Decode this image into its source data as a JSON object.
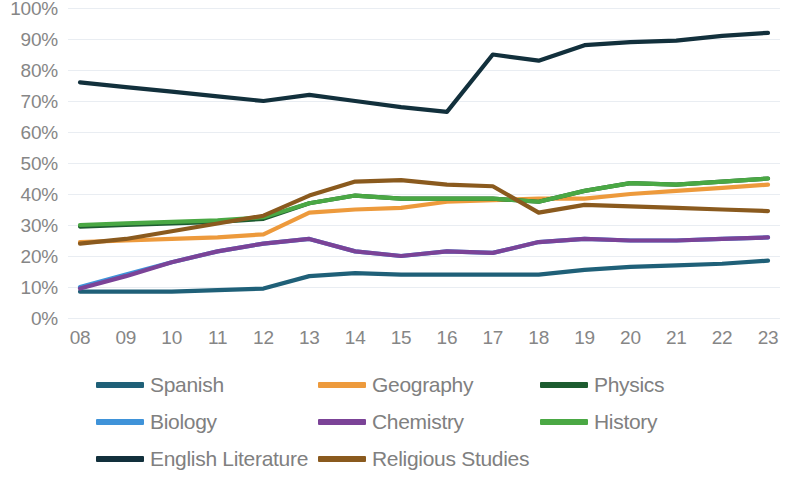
{
  "chart_data": {
    "type": "line",
    "title": "",
    "xlabel": "",
    "ylabel": "",
    "x": [
      "08",
      "09",
      "10",
      "11",
      "12",
      "13",
      "14",
      "15",
      "16",
      "17",
      "18",
      "19",
      "20",
      "21",
      "22",
      "23"
    ],
    "ylim": [
      0,
      100
    ],
    "ytick_labels": [
      "100%",
      "90%",
      "80%",
      "70%",
      "60%",
      "50%",
      "40%",
      "30%",
      "20%",
      "10%",
      "0%"
    ],
    "ytick_values": [
      100,
      90,
      80,
      70,
      60,
      50,
      40,
      30,
      20,
      10,
      0
    ],
    "grid": true,
    "legend_position": "bottom",
    "value_unit": "%",
    "series": [
      {
        "name": "Spanish",
        "color": "#1f6078",
        "values": [
          8.5,
          8.5,
          8.5,
          9,
          9.5,
          13.5,
          14.5,
          14,
          14,
          14,
          14,
          15.5,
          16.5,
          17,
          17.5,
          18.5
        ]
      },
      {
        "name": "Geography",
        "color": "#ed9a3c",
        "values": [
          24.5,
          25,
          25.5,
          26,
          27,
          34,
          35,
          35.5,
          37.5,
          38,
          38.5,
          38.5,
          40,
          41,
          42,
          43
        ]
      },
      {
        "name": "Physics",
        "color": "#1d5c30",
        "values": [
          29.5,
          30,
          30.5,
          31,
          32,
          37,
          39.5,
          38.5,
          38.5,
          38.5,
          37.5,
          41,
          43.5,
          43,
          44,
          45
        ]
      },
      {
        "name": "Biology",
        "color": "#3f93d9",
        "values": [
          10,
          14,
          18,
          21.5,
          24,
          25.5,
          21.5,
          20,
          21.5,
          21,
          24.5,
          25.5,
          25,
          25,
          25.5,
          26
        ]
      },
      {
        "name": "Chemistry",
        "color": "#7b4397",
        "values": [
          9.5,
          13.5,
          18,
          21.5,
          24,
          25.5,
          21.5,
          20,
          21.5,
          21,
          24.5,
          25.5,
          25,
          25,
          25.5,
          26
        ]
      },
      {
        "name": "History",
        "color": "#4aa844",
        "values": [
          30,
          30.5,
          31,
          31.5,
          32.5,
          37,
          39.5,
          38.5,
          38.5,
          38.5,
          37.5,
          41,
          43.5,
          43,
          44,
          45
        ]
      },
      {
        "name": "English Literature",
        "color": "#12303c",
        "values": [
          76,
          74.5,
          73,
          71.5,
          70,
          72,
          70,
          68,
          66.5,
          85,
          83,
          88,
          89,
          89.5,
          91,
          92
        ]
      },
      {
        "name": "Religious Studies",
        "color": "#8a5a1e",
        "values": [
          24,
          25.5,
          28,
          30.5,
          33,
          39.5,
          44,
          44.5,
          43,
          42.5,
          34,
          36.5,
          36,
          35.5,
          35,
          34.5
        ]
      }
    ]
  },
  "legend": {
    "rows": [
      [
        {
          "label": "Spanish",
          "color": "#1f6078",
          "left": 0
        },
        {
          "label": "Geography",
          "color": "#ed9a3c",
          "left": 222
        },
        {
          "label": "Physics",
          "color": "#1d5c30",
          "left": 444
        }
      ],
      [
        {
          "label": "Biology",
          "color": "#3f93d9",
          "left": 0
        },
        {
          "label": "Chemistry",
          "color": "#7b4397",
          "left": 222
        },
        {
          "label": "History",
          "color": "#4aa844",
          "left": 444
        }
      ],
      [
        {
          "label": "English Literature",
          "color": "#12303c",
          "left": 0
        },
        {
          "label": "Religious Studies",
          "color": "#8a5a1e",
          "left": 222
        }
      ]
    ]
  },
  "axis": {
    "gridline_color": "#e9edf2",
    "tick_color": "#868686"
  }
}
